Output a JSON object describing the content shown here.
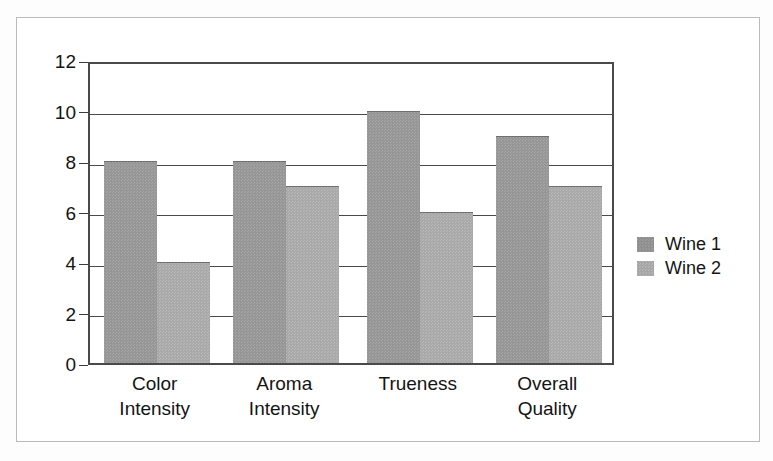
{
  "chart_data": {
    "type": "bar",
    "title": "",
    "subtitle": "",
    "xlabel": "",
    "ylabel": "",
    "categories": [
      "Color Intensity",
      "Aroma Intensity",
      "Trueness",
      "Overall Quality"
    ],
    "category_lines": [
      [
        "Color",
        "Intensity"
      ],
      [
        "Aroma",
        "Intensity"
      ],
      [
        "Trueness",
        ""
      ],
      [
        "Overall",
        "Quality"
      ]
    ],
    "series": [
      {
        "name": "Wine 1",
        "values": [
          8,
          8,
          10,
          9
        ],
        "color": "#969696"
      },
      {
        "name": "Wine 2",
        "values": [
          4,
          7,
          6,
          7
        ],
        "color": "#a9a9a9"
      }
    ],
    "ylim": [
      0,
      12
    ],
    "y_ticks": [
      0,
      2,
      4,
      6,
      8,
      10,
      12
    ],
    "y_tick_labels": [
      "0",
      "2",
      "4",
      "6",
      "8",
      "10",
      "12"
    ],
    "grid": true,
    "grid_axis": "y",
    "legend_position": "right",
    "bar_mode": "grouped"
  },
  "legend": {
    "entries": [
      {
        "label": "Wine 1"
      },
      {
        "label": "Wine 2"
      }
    ]
  },
  "axes": {
    "y_tick_labels": [
      "12",
      "10",
      "8",
      "6",
      "4",
      "2",
      "0"
    ]
  },
  "colors": {
    "series_1": "#969696",
    "series_2": "#a9a9a9",
    "axis": "#4a4a4a",
    "frame": "#b9bcbf",
    "text": "#141414"
  }
}
